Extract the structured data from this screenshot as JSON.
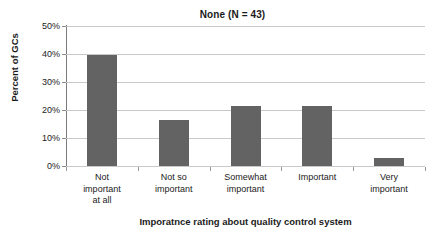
{
  "chart_data": {
    "type": "bar",
    "title": "None (N = 43)",
    "xlabel": "Imporatnce rating about quality control system",
    "ylabel": "Percent of GCs",
    "categories": [
      "Not important at all",
      "Not so important",
      "Somewhat important",
      "Important",
      "Very important"
    ],
    "category_lines": [
      [
        "Not",
        "important",
        "at all"
      ],
      [
        "Not so",
        "important"
      ],
      [
        "Somewhat",
        "important"
      ],
      [
        "Important"
      ],
      [
        "Very",
        "important"
      ]
    ],
    "values": [
      39.5,
      16.5,
      21.4,
      21.5,
      3.0
    ],
    "ylim": [
      0,
      50
    ],
    "yticks": [
      0,
      10,
      20,
      30,
      40,
      50
    ],
    "ytick_labels": [
      "0%",
      "10%",
      "20%",
      "30%",
      "40%",
      "50%"
    ],
    "grid": true,
    "legend": false,
    "bar_color": "#636363",
    "gridline_color": "#c9c9c9",
    "axis_color": "#8a8a8a",
    "n": 43
  }
}
